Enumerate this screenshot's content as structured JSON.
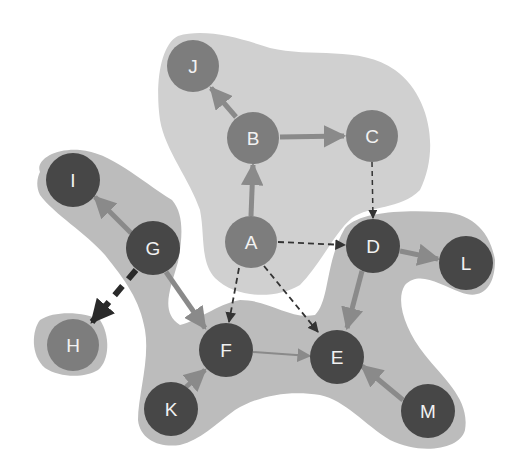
{
  "colors": {
    "background": "#ffffff",
    "region_light": "#cfcfcf",
    "region_mid": "#b9b9b9",
    "node_mid": "#7d7d7d",
    "node_dark": "#474747",
    "edge_solid": "#8a8a8a",
    "edge_dashed": "#333333",
    "edge_heavy": "#2a2a2a",
    "label": "#f2f2f2"
  },
  "regions": [
    {
      "id": "top-cluster",
      "members": [
        "J",
        "B",
        "C",
        "A"
      ]
    },
    {
      "id": "left-cluster",
      "members": [
        "I",
        "G",
        "F",
        "E",
        "K",
        "M",
        "D",
        "L"
      ]
    },
    {
      "id": "h-cluster",
      "members": [
        "H"
      ]
    }
  ],
  "nodes": [
    {
      "id": "J",
      "label": "J",
      "x": 193,
      "y": 66,
      "shade": "mid"
    },
    {
      "id": "B",
      "label": "B",
      "x": 253,
      "y": 138,
      "shade": "mid"
    },
    {
      "id": "C",
      "label": "C",
      "x": 372,
      "y": 136,
      "shade": "mid"
    },
    {
      "id": "A",
      "label": "A",
      "x": 251,
      "y": 242,
      "shade": "mid"
    },
    {
      "id": "D",
      "label": "D",
      "x": 373,
      "y": 246,
      "shade": "dark"
    },
    {
      "id": "L",
      "label": "L",
      "x": 466,
      "y": 263,
      "shade": "dark"
    },
    {
      "id": "I",
      "label": "I",
      "x": 73,
      "y": 180,
      "shade": "dark"
    },
    {
      "id": "G",
      "label": "G",
      "x": 153,
      "y": 248,
      "shade": "dark"
    },
    {
      "id": "H",
      "label": "H",
      "x": 73,
      "y": 345,
      "shade": "mid"
    },
    {
      "id": "F",
      "label": "F",
      "x": 226,
      "y": 350,
      "shade": "dark"
    },
    {
      "id": "E",
      "label": "E",
      "x": 337,
      "y": 357,
      "shade": "dark"
    },
    {
      "id": "K",
      "label": "K",
      "x": 171,
      "y": 409,
      "shade": "dark"
    },
    {
      "id": "M",
      "label": "M",
      "x": 428,
      "y": 411,
      "shade": "dark"
    }
  ],
  "edges": [
    {
      "from": "A",
      "to": "B",
      "style": "solid"
    },
    {
      "from": "B",
      "to": "J",
      "style": "solid"
    },
    {
      "from": "B",
      "to": "C",
      "style": "solid"
    },
    {
      "from": "C",
      "to": "D",
      "style": "dashed"
    },
    {
      "from": "A",
      "to": "D",
      "style": "dashed"
    },
    {
      "from": "A",
      "to": "F",
      "style": "dashed"
    },
    {
      "from": "A",
      "to": "E",
      "style": "dashed"
    },
    {
      "from": "D",
      "to": "L",
      "style": "solid"
    },
    {
      "from": "D",
      "to": "E",
      "style": "solid"
    },
    {
      "from": "G",
      "to": "I",
      "style": "solid"
    },
    {
      "from": "G",
      "to": "F",
      "style": "solid"
    },
    {
      "from": "G",
      "to": "H",
      "style": "heavy-dashed"
    },
    {
      "from": "F",
      "to": "E",
      "style": "thin"
    },
    {
      "from": "K",
      "to": "F",
      "style": "solid"
    },
    {
      "from": "M",
      "to": "E",
      "style": "solid"
    }
  ]
}
